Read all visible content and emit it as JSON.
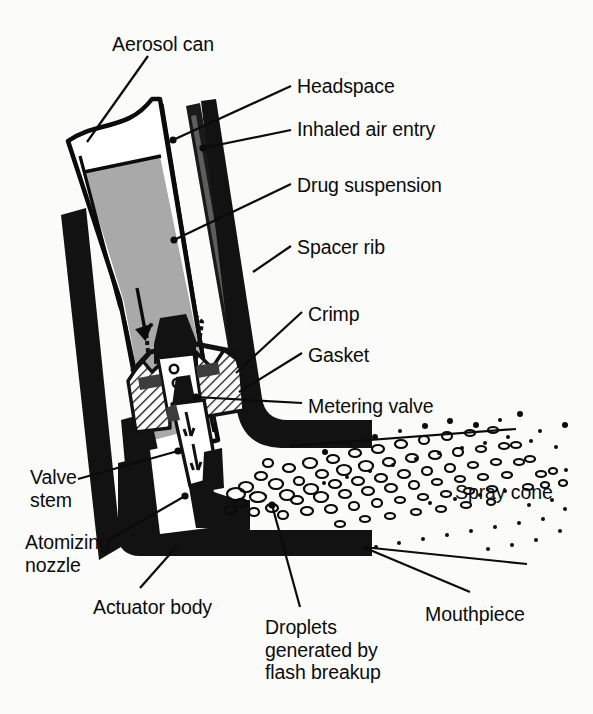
{
  "figure": {
    "background_color": "#fbfbf9",
    "ink_color": "#0b0b0b",
    "suspension_fill": "#a9a9a9",
    "hatch_color": "#151515"
  },
  "labels": [
    {
      "id": "aerosol-can",
      "text": "Aerosol can",
      "x": 112,
      "y": 33,
      "align": "left"
    },
    {
      "id": "headspace",
      "text": "Headspace",
      "x": 297,
      "y": 75,
      "align": "left"
    },
    {
      "id": "inhaled-air-entry",
      "text": "Inhaled air entry",
      "x": 297,
      "y": 118,
      "align": "left"
    },
    {
      "id": "drug-suspension",
      "text": "Drug suspension",
      "x": 297,
      "y": 174,
      "align": "left"
    },
    {
      "id": "spacer-rib",
      "text": "Spacer rib",
      "x": 297,
      "y": 236,
      "align": "left"
    },
    {
      "id": "crimp",
      "text": "Crimp",
      "x": 308,
      "y": 303,
      "align": "left"
    },
    {
      "id": "gasket",
      "text": "Gasket",
      "x": 308,
      "y": 344,
      "align": "left"
    },
    {
      "id": "metering-valve",
      "text": "Metering valve",
      "x": 308,
      "y": 395,
      "align": "left"
    },
    {
      "id": "valve-stem",
      "text": "Valve\nstem",
      "x": 30,
      "y": 466,
      "align": "left"
    },
    {
      "id": "spray-cone",
      "text": "Spray cone",
      "x": 455,
      "y": 481,
      "align": "left"
    },
    {
      "id": "atomizing-nozzle",
      "text": "Atomizing\nnozzle",
      "x": 25,
      "y": 531,
      "align": "left"
    },
    {
      "id": "actuator-body",
      "text": "Actuator body",
      "x": 93,
      "y": 596,
      "align": "left"
    },
    {
      "id": "mouthpiece",
      "text": "Mouthpiece",
      "x": 425,
      "y": 603,
      "align": "left"
    },
    {
      "id": "droplets-flash",
      "text": "Droplets\ngenerated by\nflash breakup",
      "x": 265,
      "y": 616,
      "align": "left"
    }
  ],
  "leaders": [
    {
      "id": "leader-aerosol-can",
      "points": "148,56 87,142",
      "dot": null
    },
    {
      "id": "leader-headspace",
      "points": "291,86 173,140",
      "dot": "173,140"
    },
    {
      "id": "leader-inhaled-air",
      "points": "291,130 203,148",
      "dot": "203,148"
    },
    {
      "id": "leader-drug-suspension",
      "points": "291,184 174,240",
      "dot": "174,240"
    },
    {
      "id": "leader-spacer-rib",
      "points": "291,246 253,272",
      "dot": null
    },
    {
      "id": "leader-crimp",
      "points": "302,312 236,373",
      "dot": null
    },
    {
      "id": "leader-gasket",
      "points": "302,353 239,392",
      "dot": null
    },
    {
      "id": "leader-metering-valve",
      "points": "302,403 196,397",
      "dot": "196,397"
    },
    {
      "id": "leader-valve-stem",
      "points": "78,479 178,451",
      "dot": "178,451"
    },
    {
      "id": "leader-atomizing-nozzle",
      "points": "107,541 185,496",
      "dot": "185,496"
    },
    {
      "id": "leader-actuator-body",
      "points": "140,588 178,545",
      "dot": null
    },
    {
      "id": "leader-spray-cone",
      "points": "516,429 290,446",
      "dot": null
    },
    {
      "id": "leader-mouthpiece",
      "points": "470,592 363,547",
      "dot": null
    },
    {
      "id": "leader-mouthpiece-2",
      "points": "527,564 363,547",
      "dot": null
    },
    {
      "id": "leader-droplets",
      "points": "300,607 272,505",
      "dot": "272,505"
    }
  ],
  "spray": {
    "rings": [
      [
        246,
        487,
        7,
        5
      ],
      [
        261,
        476,
        6,
        4
      ],
      [
        276,
        484,
        7,
        5
      ],
      [
        258,
        497,
        8,
        5
      ],
      [
        241,
        503,
        6,
        4
      ],
      [
        289,
        468,
        6,
        4
      ],
      [
        299,
        481,
        5,
        4
      ],
      [
        287,
        495,
        7,
        5
      ],
      [
        272,
        508,
        6,
        4
      ],
      [
        254,
        512,
        5,
        4
      ],
      [
        310,
        463,
        7,
        5
      ],
      [
        322,
        474,
        6,
        4
      ],
      [
        311,
        489,
        7,
        5
      ],
      [
        297,
        500,
        6,
        4
      ],
      [
        283,
        515,
        5,
        4
      ],
      [
        333,
        459,
        6,
        4
      ],
      [
        344,
        470,
        7,
        5
      ],
      [
        335,
        484,
        6,
        4
      ],
      [
        321,
        497,
        7,
        5
      ],
      [
        307,
        511,
        6,
        4
      ],
      [
        355,
        453,
        6,
        4
      ],
      [
        366,
        466,
        7,
        5
      ],
      [
        358,
        481,
        6,
        4
      ],
      [
        345,
        494,
        6,
        4
      ],
      [
        331,
        509,
        6,
        4
      ],
      [
        378,
        449,
        6,
        4
      ],
      [
        389,
        462,
        6,
        4
      ],
      [
        381,
        478,
        6,
        4
      ],
      [
        368,
        491,
        6,
        4
      ],
      [
        354,
        506,
        5,
        4
      ],
      [
        401,
        444,
        6,
        4
      ],
      [
        412,
        458,
        6,
        4
      ],
      [
        404,
        474,
        6,
        4
      ],
      [
        391,
        488,
        6,
        4
      ],
      [
        377,
        503,
        5,
        4
      ],
      [
        424,
        440,
        5,
        4
      ],
      [
        435,
        455,
        6,
        4
      ],
      [
        427,
        471,
        5,
        4
      ],
      [
        414,
        485,
        5,
        4
      ],
      [
        400,
        500,
        5,
        3
      ],
      [
        447,
        436,
        5,
        4
      ],
      [
        458,
        452,
        5,
        4
      ],
      [
        450,
        468,
        5,
        4
      ],
      [
        437,
        482,
        5,
        3
      ],
      [
        423,
        497,
        5,
        3
      ],
      [
        470,
        433,
        5,
        3
      ],
      [
        481,
        449,
        5,
        3
      ],
      [
        473,
        465,
        5,
        3
      ],
      [
        460,
        479,
        5,
        3
      ],
      [
        446,
        494,
        5,
        3
      ],
      [
        493,
        430,
        5,
        3
      ],
      [
        504,
        446,
        5,
        3
      ],
      [
        496,
        462,
        5,
        3
      ],
      [
        483,
        477,
        5,
        3
      ],
      [
        469,
        491,
        5,
        3
      ],
      [
        516,
        445,
        5,
        3
      ],
      [
        519,
        462,
        5,
        3
      ],
      [
        507,
        475,
        5,
        3
      ],
      [
        492,
        489,
        5,
        3
      ],
      [
        530,
        459,
        5,
        3
      ],
      [
        541,
        474,
        5,
        3
      ],
      [
        528,
        487,
        5,
        3
      ],
      [
        553,
        471,
        4,
        3
      ],
      [
        545,
        485,
        4,
        3
      ],
      [
        563,
        483,
        4,
        3
      ],
      [
        236,
        494,
        9,
        6
      ],
      [
        268,
        463,
        5,
        4
      ],
      [
        230,
        510,
        6,
        4
      ],
      [
        340,
        524,
        5,
        3
      ],
      [
        365,
        519,
        5,
        3
      ],
      [
        390,
        516,
        5,
        3
      ],
      [
        416,
        512,
        5,
        3
      ],
      [
        441,
        509,
        5,
        3
      ],
      [
        466,
        505,
        5,
        3
      ],
      [
        491,
        502,
        4,
        3
      ]
    ],
    "dots": [
      [
        325,
        452,
        3
      ],
      [
        350,
        444,
        3
      ],
      [
        375,
        437,
        3
      ],
      [
        400,
        431,
        2
      ],
      [
        425,
        426,
        3
      ],
      [
        450,
        421,
        3
      ],
      [
        476,
        425,
        3
      ],
      [
        500,
        420,
        2
      ],
      [
        520,
        414,
        3
      ],
      [
        540,
        431,
        2
      ],
      [
        556,
        447,
        2
      ],
      [
        565,
        425,
        3
      ],
      [
        531,
        441,
        2
      ],
      [
        508,
        437,
        2
      ],
      [
        485,
        443,
        2
      ],
      [
        462,
        448,
        2
      ],
      [
        439,
        453,
        2
      ],
      [
        416,
        459,
        2
      ],
      [
        393,
        465,
        2
      ],
      [
        370,
        471,
        2
      ],
      [
        347,
        477,
        2
      ],
      [
        324,
        483,
        2
      ],
      [
        430,
        503,
        2
      ],
      [
        455,
        499,
        2
      ],
      [
        480,
        495,
        2
      ],
      [
        505,
        491,
        2
      ],
      [
        529,
        505,
        2
      ],
      [
        552,
        500,
        2
      ],
      [
        566,
        470,
        2
      ],
      [
        543,
        519,
        2
      ],
      [
        519,
        523,
        2
      ],
      [
        495,
        527,
        2
      ],
      [
        471,
        531,
        2
      ],
      [
        447,
        535,
        2
      ],
      [
        423,
        539,
        2
      ],
      [
        399,
        543,
        2
      ],
      [
        376,
        547,
        2
      ],
      [
        565,
        509,
        2
      ],
      [
        560,
        531,
        2
      ],
      [
        536,
        540,
        2
      ],
      [
        512,
        545,
        2
      ],
      [
        488,
        549,
        2
      ]
    ]
  }
}
